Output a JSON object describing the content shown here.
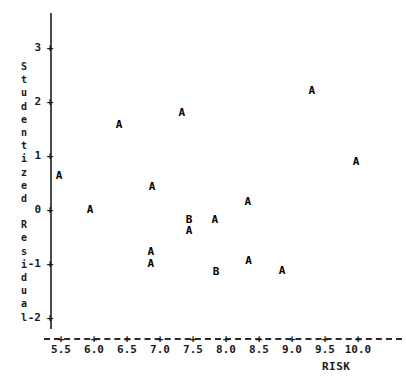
{
  "chart_data": {
    "type": "scatter",
    "title": "",
    "xlabel": "RISK",
    "ylabel": "Studentized Residual",
    "xlim": [
      5.2,
      10.4
    ],
    "ylim": [
      -2.35,
      3.35
    ],
    "grid": false,
    "legend_position": "none",
    "point_glyph_meaning": {
      "A": "1 observation",
      "B": "2 observations"
    },
    "xticks": [
      5.5,
      6.0,
      6.5,
      7.0,
      7.5,
      8.0,
      8.5,
      9.0,
      9.5,
      10.0
    ],
    "xtick_labels": [
      "5.5",
      "6.0",
      "6.5",
      "7.0",
      "7.5",
      "8.0",
      "8.5",
      "9.0",
      "9.5",
      "10.0"
    ],
    "yticks": [
      3,
      2,
      1,
      0,
      -1,
      -2
    ],
    "ytick_labels": [
      "3",
      "2",
      "1",
      "0",
      "-1",
      "-2"
    ],
    "points": [
      {
        "label": "A",
        "x": 5.47,
        "y": 0.63
      },
      {
        "label": "A",
        "x": 5.94,
        "y": 0.0
      },
      {
        "label": "A",
        "x": 6.38,
        "y": 1.58
      },
      {
        "label": "A",
        "x": 6.88,
        "y": 0.43
      },
      {
        "label": "A",
        "x": 6.86,
        "y": -0.78
      },
      {
        "label": "A",
        "x": 6.86,
        "y": -1.0
      },
      {
        "label": "A",
        "x": 7.33,
        "y": 1.8
      },
      {
        "label": "B",
        "x": 7.44,
        "y": -0.18
      },
      {
        "label": "A",
        "x": 7.44,
        "y": -0.38
      },
      {
        "label": "A",
        "x": 7.83,
        "y": -0.19
      },
      {
        "label": "B",
        "x": 7.85,
        "y": -1.15
      },
      {
        "label": "A",
        "x": 8.33,
        "y": 0.15
      },
      {
        "label": "A",
        "x": 8.34,
        "y": -0.95
      },
      {
        "label": "A",
        "x": 8.85,
        "y": -1.13
      },
      {
        "label": "A",
        "x": 9.3,
        "y": 2.2
      },
      {
        "label": "A",
        "x": 9.97,
        "y": 0.88
      }
    ]
  },
  "axis": {
    "y_title_chars": [
      "S",
      "t",
      "u",
      "d",
      "e",
      "n",
      "t",
      "i",
      "z",
      "e",
      "d",
      " ",
      "R",
      "e",
      "s",
      "i",
      "d",
      "u",
      "a",
      "l"
    ],
    "x_title": "RISK",
    "tick_glyph": "+"
  },
  "colors": {
    "axis": "#4a4a4a",
    "text": "#1a1a1a",
    "point": "#000000",
    "background": "#ffffff"
  }
}
